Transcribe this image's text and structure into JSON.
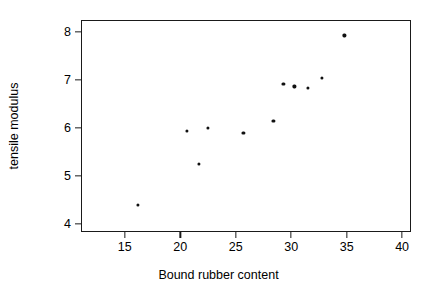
{
  "chart_data": {
    "type": "scatter",
    "title": "",
    "xlabel": "Bound rubber content",
    "ylabel": "tensile modulus",
    "xlim": [
      11.05,
      40.8
    ],
    "ylim": [
      3.83,
      8.24
    ],
    "xticks": [
      15,
      20,
      25,
      30,
      35,
      40
    ],
    "yticks": [
      4,
      5,
      6,
      7,
      8
    ],
    "xticklabels": [
      "15",
      "20",
      "25",
      "30",
      "35",
      "40"
    ],
    "yticklabels": [
      "4",
      "5",
      "6",
      "7",
      "8"
    ],
    "grid": false,
    "legend": false,
    "marker": "filled-circle",
    "marker_color": "#111111",
    "frame_color": "#1a1a1a",
    "background": "#ffffff",
    "n_points": 11,
    "x": [
      16.1,
      20.5,
      21.6,
      22.4,
      25.6,
      28.3,
      29.2,
      30.2,
      31.4,
      32.7,
      34.7
    ],
    "y": [
      4.42,
      5.95,
      5.27,
      6.02,
      5.91,
      6.17,
      6.93,
      6.88,
      6.85,
      7.06,
      7.94
    ],
    "points": [
      {
        "x": 16.1,
        "y": 4.42
      },
      {
        "x": 20.5,
        "y": 5.95
      },
      {
        "x": 21.6,
        "y": 5.27
      },
      {
        "x": 22.4,
        "y": 6.02
      },
      {
        "x": 25.6,
        "y": 5.91
      },
      {
        "x": 28.3,
        "y": 6.17
      },
      {
        "x": 29.2,
        "y": 6.93
      },
      {
        "x": 30.2,
        "y": 6.88
      },
      {
        "x": 31.4,
        "y": 6.85
      },
      {
        "x": 32.7,
        "y": 7.06
      },
      {
        "x": 34.7,
        "y": 7.94
      }
    ]
  }
}
